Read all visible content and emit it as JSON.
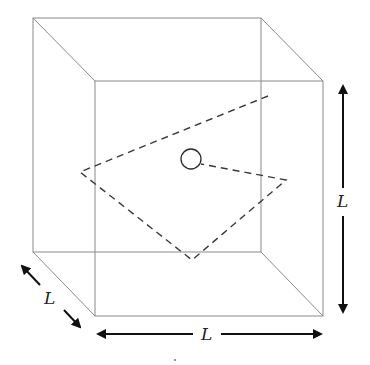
{
  "figure": {
    "type": "3D cube with random-walk path (particle in a box)",
    "cube": {
      "back_face": {
        "x1": 33,
        "y1": 18,
        "x2": 261,
        "y2": 252
      },
      "front_face": {
        "x1": 95,
        "y1": 81,
        "x2": 323,
        "y2": 316
      },
      "edge_color": "#8a8a8a"
    },
    "path": {
      "style": "dashed",
      "points": [
        [
          268,
          96
        ],
        [
          80,
          172
        ],
        [
          192,
          260
        ],
        [
          286,
          180
        ],
        [
          201,
          164
        ]
      ],
      "color": "#3a3a3a"
    },
    "particle": {
      "cx": 191,
      "cy": 159,
      "r": 10,
      "shape": "circle"
    },
    "dimensions": {
      "depth": {
        "label": "L",
        "orientation": "diagonal"
      },
      "width": {
        "label": "L",
        "orientation": "horizontal"
      },
      "height": {
        "label": "L",
        "orientation": "vertical"
      }
    }
  }
}
